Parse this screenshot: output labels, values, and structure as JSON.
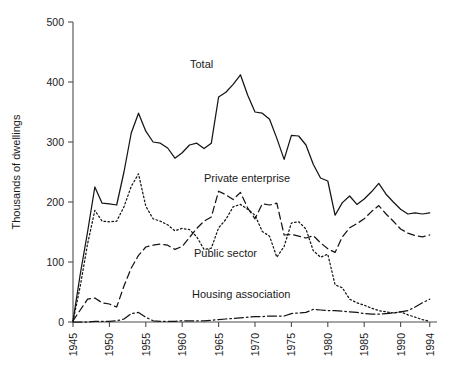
{
  "chart_data": {
    "type": "line",
    "title": "",
    "xlabel": "",
    "ylabel": "Thousands of dwellings",
    "xlim": [
      1945,
      1995
    ],
    "ylim": [
      0,
      500
    ],
    "grid": false,
    "legend": "inline-annotations",
    "y_ticks": [
      0,
      100,
      200,
      300,
      400,
      500
    ],
    "y_tick_labels": [
      "0",
      "100",
      "200",
      "300",
      "400",
      "500"
    ],
    "x_ticks": [
      1945,
      1950,
      1955,
      1960,
      1965,
      1970,
      1975,
      1980,
      1985,
      1990,
      1994
    ],
    "x_tick_labels": [
      "1945",
      "1950",
      "1955",
      "1960",
      "1965",
      "1970",
      "1975",
      "1980",
      "1985",
      "1990",
      "1994"
    ],
    "x": [
      1945,
      1946,
      1947,
      1948,
      1949,
      1950,
      1951,
      1952,
      1953,
      1954,
      1955,
      1956,
      1957,
      1958,
      1959,
      1960,
      1961,
      1962,
      1963,
      1964,
      1965,
      1966,
      1967,
      1968,
      1969,
      1970,
      1971,
      1972,
      1973,
      1974,
      1975,
      1976,
      1977,
      1978,
      1979,
      1980,
      1981,
      1982,
      1983,
      1984,
      1985,
      1986,
      1987,
      1988,
      1989,
      1990,
      1991,
      1992,
      1993,
      1994
    ],
    "series": [
      {
        "name": "Total",
        "style": "solid",
        "values": [
          2,
          80,
          150,
          225,
          198,
          197,
          195,
          250,
          315,
          348,
          318,
          300,
          298,
          290,
          273,
          282,
          295,
          298,
          289,
          298,
          375,
          383,
          396,
          412,
          378,
          350,
          348,
          338,
          306,
          271,
          311,
          310,
          295,
          263,
          240,
          235,
          178,
          199,
          210,
          196,
          205,
          217,
          231,
          213,
          200,
          188,
          180,
          182,
          180,
          182
        ],
        "final_value": 182
      },
      {
        "name": "Private enterprise",
        "style": "dashed",
        "values": [
          2,
          20,
          38,
          40,
          32,
          30,
          25,
          60,
          90,
          111,
          125,
          128,
          130,
          128,
          121,
          126,
          141,
          156,
          168,
          175,
          218,
          212,
          204,
          216,
          190,
          172,
          197,
          195,
          198,
          145,
          146,
          143,
          140,
          144,
          132,
          122,
          116,
          142,
          157,
          164,
          172,
          184,
          194,
          180,
          168,
          155,
          148,
          144,
          142,
          145
        ],
        "final_value": 145
      },
      {
        "name": "Public sector",
        "style": "dotted",
        "values": [
          1,
          60,
          130,
          186,
          168,
          167,
          168,
          192,
          226,
          247,
          193,
          172,
          168,
          162,
          152,
          156,
          154,
          142,
          121,
          123,
          157,
          171,
          192,
          196,
          188,
          178,
          151,
          143,
          108,
          126,
          165,
          167,
          155,
          119,
          108,
          113,
          62,
          57,
          38,
          32,
          28,
          23,
          19,
          17,
          15,
          17,
          12,
          8,
          4,
          1
        ],
        "final_value": 1
      },
      {
        "name": "Housing association",
        "style": "dash-dot",
        "values": [
          0,
          0,
          0,
          1,
          1,
          1,
          2,
          5,
          14,
          16,
          8,
          2,
          1,
          1,
          1,
          2,
          2,
          2,
          2,
          3,
          4,
          5,
          6,
          7,
          8,
          9,
          9,
          10,
          10,
          10,
          14,
          15,
          16,
          21,
          20,
          19,
          19,
          18,
          17,
          16,
          14,
          13,
          13,
          14,
          15,
          17,
          19,
          25,
          32,
          38
        ],
        "final_value": 38
      }
    ],
    "annotations": [
      {
        "text": "Total",
        "x_px": 190,
        "y_px": 68
      },
      {
        "text": "Private enterprise",
        "x_px": 204,
        "y_px": 182
      },
      {
        "text": "Public sector",
        "x_px": 194,
        "y_px": 257
      },
      {
        "text": "Housing association",
        "x_px": 192,
        "y_px": 298
      }
    ]
  },
  "axis": {
    "y_title": "Thousands of dwellings"
  }
}
